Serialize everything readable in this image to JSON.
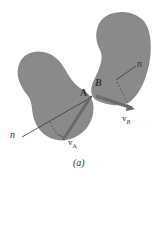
{
  "figure": {
    "caption": "(a)",
    "colors": {
      "body_fill": "#8a8a8a",
      "body_fill_dark": "#7a7a7a",
      "line": "#3a3a3a",
      "vector": "#6a6a6a",
      "background": "#ffffff"
    },
    "bodies": [
      {
        "name": "left-body",
        "point_label": "A",
        "velocity_label": "v",
        "velocity_subscript": "A",
        "normal_label": "n"
      },
      {
        "name": "right-body",
        "point_label": "B",
        "velocity_label": "v",
        "velocity_subscript": "B",
        "normal_label": "n"
      }
    ]
  }
}
